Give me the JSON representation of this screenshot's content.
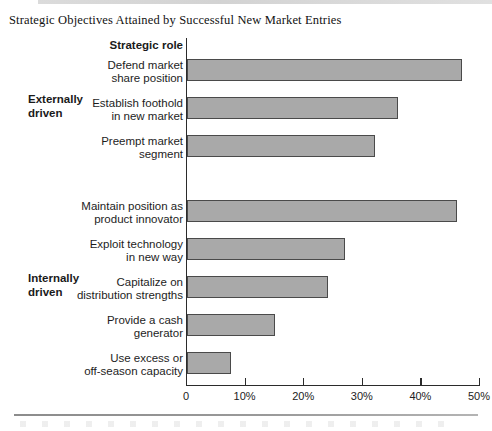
{
  "chart_data": {
    "type": "bar",
    "orientation": "horizontal",
    "title": "Strategic Objectives Attained by Successful New Market Entries",
    "category_header": "Strategic role",
    "xlabel": "",
    "ylabel": "",
    "xlim": [
      0,
      50
    ],
    "grid": false,
    "legend": null,
    "bar_color": "#a9a9a9",
    "bar_edge_color": "#4a4a4a",
    "xticks": [
      0,
      10,
      20,
      30,
      40,
      50
    ],
    "xtick_labels": [
      "0",
      "10%",
      "20%",
      "30%",
      "40%",
      "50%"
    ],
    "groups": [
      {
        "label": "Externally\ndriven",
        "categories": [
          "Defend market\nshare position",
          "Establish foothold\nin new market",
          "Preempt market\nsegment"
        ],
        "values": [
          47,
          36,
          32
        ]
      },
      {
        "label": "Internally\ndriven",
        "categories": [
          "Maintain position as\nproduct innovator",
          "Exploit technology\nin new way",
          "Capitalize on\ndistribution strengths",
          "Provide a cash\ngenerator",
          "Use excess or\noff-season capacity"
        ],
        "values": [
          46,
          27,
          24,
          15,
          7.5
        ]
      }
    ],
    "categories": [
      "Defend market\nshare position",
      "Establish foothold\nin new market",
      "Preempt market\nsegment",
      "Maintain position as\nproduct innovator",
      "Exploit technology\nin new way",
      "Capitalize on\ndistribution strengths",
      "Provide a cash\ngenerator",
      "Use excess or\noff-season capacity"
    ],
    "values": [
      47,
      36,
      32,
      46,
      27,
      24,
      15,
      7.5
    ]
  }
}
